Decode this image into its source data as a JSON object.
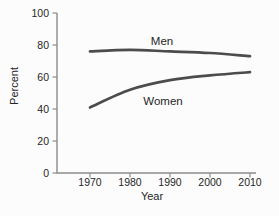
{
  "chart_data": {
    "type": "line",
    "title": "",
    "xlabel": "Year",
    "ylabel": "Percent",
    "x": [
      1970,
      1980,
      1990,
      2000,
      2010
    ],
    "xtick_labels": [
      "1970",
      "1980",
      "1990",
      "2000",
      "2010"
    ],
    "yticks": [
      0,
      20,
      40,
      60,
      80,
      100
    ],
    "ylim": [
      0,
      100
    ],
    "grid": false,
    "legend": "inline labels next to lines",
    "series": [
      {
        "name": "Men",
        "values": [
          76,
          77,
          76,
          75,
          73
        ]
      },
      {
        "name": "Women",
        "values": [
          41,
          52,
          58,
          61,
          63
        ]
      }
    ],
    "colors": {
      "line": "#4c4c4c",
      "axis": "#8c8c8c",
      "text": "#262626",
      "background": "#fcfcfc"
    }
  }
}
